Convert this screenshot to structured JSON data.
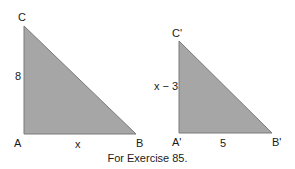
{
  "figure": {
    "caption": "For Exercise 85.",
    "fill_color": "#a6a6a6",
    "stroke_color": "#7a7a7a",
    "triangle_1": {
      "vertices": {
        "C": "C",
        "A": "A",
        "B": "B"
      },
      "side_labels": {
        "AC": "8",
        "AB": "x"
      },
      "points": "24,26 24,134 136,134"
    },
    "triangle_2": {
      "vertices": {
        "C": "C'",
        "A": "A'",
        "B": "B'"
      },
      "side_labels": {
        "AC": "x − 3",
        "AB": "5"
      },
      "points": "179,41 179,133 272,133"
    }
  }
}
